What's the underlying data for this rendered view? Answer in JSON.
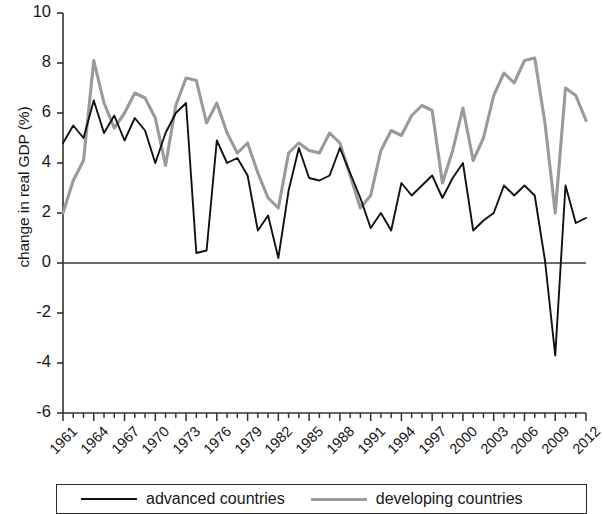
{
  "chart_data": {
    "type": "line",
    "title": "",
    "xlabel": "",
    "ylabel": "change in real GDP (%)",
    "ylim": [
      -6,
      10
    ],
    "xlim": [
      1961,
      2012
    ],
    "ytick_labels": [
      "10",
      "8",
      "6",
      "4",
      "2",
      "0",
      "-2",
      "-4",
      "-6"
    ],
    "yticks": [
      10,
      8,
      6,
      4,
      2,
      0,
      -2,
      -4,
      -6
    ],
    "xtick_labels": [
      "1961",
      "1964",
      "1967",
      "1970",
      "1973",
      "1976",
      "1979",
      "1982",
      "1985",
      "1988",
      "1991",
      "1994",
      "1997",
      "2000",
      "2003",
      "2006",
      "2009",
      "2012"
    ],
    "xticks": [
      1961,
      1964,
      1967,
      1970,
      1973,
      1976,
      1979,
      1982,
      1985,
      1988,
      1991,
      1994,
      1997,
      2000,
      2003,
      2006,
      2009,
      2012
    ],
    "grid": false,
    "zero_line": true,
    "legend_position": "bottom",
    "x": [
      1961,
      1962,
      1963,
      1964,
      1965,
      1966,
      1967,
      1968,
      1969,
      1970,
      1971,
      1972,
      1973,
      1974,
      1975,
      1976,
      1977,
      1978,
      1979,
      1980,
      1981,
      1982,
      1983,
      1984,
      1985,
      1986,
      1987,
      1988,
      1989,
      1990,
      1991,
      1992,
      1993,
      1994,
      1995,
      1996,
      1997,
      1998,
      1999,
      2000,
      2001,
      2002,
      2003,
      2004,
      2005,
      2006,
      2007,
      2008,
      2009,
      2010,
      2011,
      2012
    ],
    "series": [
      {
        "name": "advanced countries",
        "color": "#111111",
        "values": [
          4.8,
          5.5,
          5.0,
          6.5,
          5.2,
          5.9,
          4.9,
          5.8,
          5.3,
          4.0,
          5.2,
          6.0,
          6.4,
          0.4,
          0.5,
          4.9,
          4.0,
          4.2,
          3.5,
          1.3,
          1.9,
          0.2,
          2.9,
          4.6,
          3.4,
          3.3,
          3.5,
          4.6,
          3.6,
          2.6,
          1.4,
          2.0,
          1.3,
          3.2,
          2.7,
          3.1,
          3.5,
          2.6,
          3.4,
          4.0,
          1.3,
          1.7,
          2.0,
          3.1,
          2.7,
          3.1,
          2.7,
          0.1,
          -3.7,
          3.1,
          1.6,
          1.8
        ]
      },
      {
        "name": "developing countries",
        "color": "#9a9a9a",
        "values": [
          2.0,
          3.3,
          4.1,
          8.1,
          6.4,
          5.4,
          6.0,
          6.8,
          6.6,
          5.8,
          3.9,
          6.3,
          7.4,
          7.3,
          5.6,
          6.4,
          5.2,
          4.4,
          4.8,
          3.6,
          2.6,
          2.2,
          4.4,
          4.8,
          4.5,
          4.4,
          5.2,
          4.8,
          3.5,
          2.2,
          2.7,
          4.5,
          5.3,
          5.1,
          5.9,
          6.3,
          6.1,
          3.2,
          4.5,
          6.2,
          4.1,
          5.0,
          6.7,
          7.6,
          7.2,
          8.1,
          8.2,
          5.6,
          2.0,
          7.0,
          6.7,
          5.7
        ]
      }
    ]
  },
  "legend": {
    "entries": [
      {
        "label": "advanced countries",
        "swatch": "black-line-swatch"
      },
      {
        "label": "developing countries",
        "swatch": "gray-line-swatch"
      }
    ]
  }
}
